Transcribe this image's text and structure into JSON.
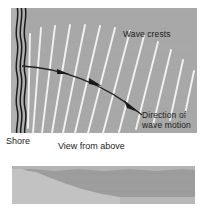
{
  "figure": {
    "kind": "wave-refraction-diagram",
    "background_color": "#ffffff"
  },
  "plan_view": {
    "name": "View from above",
    "background_color": "#a8a8a8",
    "shore_line_color": "#1a1a1a",
    "wave_crest_color": "#f2f2f2",
    "ray_color": "#222222",
    "shore_line_count": 3,
    "wave_crest_count": 13,
    "labels": {
      "wave_crests": "Wave crests",
      "direction_of_wave_motion_line1": "Direction of",
      "direction_of_wave_motion_line2": "wave motion"
    },
    "arrowhead_count": 3
  },
  "captions": {
    "shore": "Shore",
    "view_from_above": "View from above"
  },
  "profile_view": {
    "name": "Cross-section profile",
    "water_color": "#9d9d9d",
    "seabed_color": "#c2c2c2",
    "bottom_strip_color": "#b8b8b8"
  }
}
